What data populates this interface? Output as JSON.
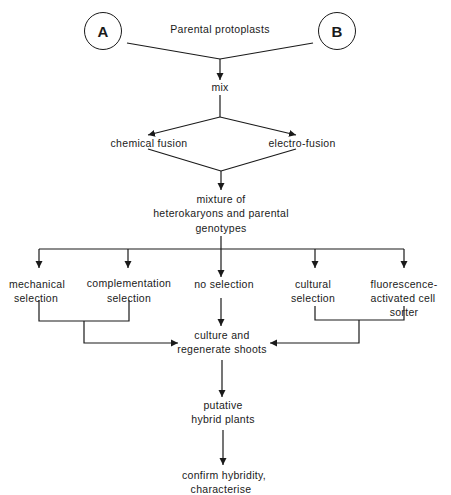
{
  "diagram": {
    "title_label": "Parental protoplasts",
    "parents": [
      {
        "label": "A"
      },
      {
        "label": "B"
      }
    ],
    "steps": {
      "mix": "mix",
      "chemical_fusion": "chemical fusion",
      "electro_fusion": "electro-fusion",
      "mixture": [
        "mixture of",
        "heterokaryons and parental",
        "genotypes"
      ],
      "selection": {
        "mechanical": [
          "mechanical",
          "selection"
        ],
        "complementation": [
          "complementation",
          "selection"
        ],
        "none": [
          "no selection"
        ],
        "cultural": [
          "cultural",
          "selection"
        ],
        "facs": [
          "fluorescence-",
          "activated cell",
          "sorter"
        ]
      },
      "culture": [
        "culture and",
        "regenerate shoots"
      ],
      "putative": [
        "putative",
        "hybrid plants"
      ],
      "confirm": [
        "confirm hybridity,",
        "characterise"
      ]
    },
    "colors": {
      "line": "#1a1a1a",
      "text": "#1a1a1a",
      "background": "#ffffff"
    }
  }
}
